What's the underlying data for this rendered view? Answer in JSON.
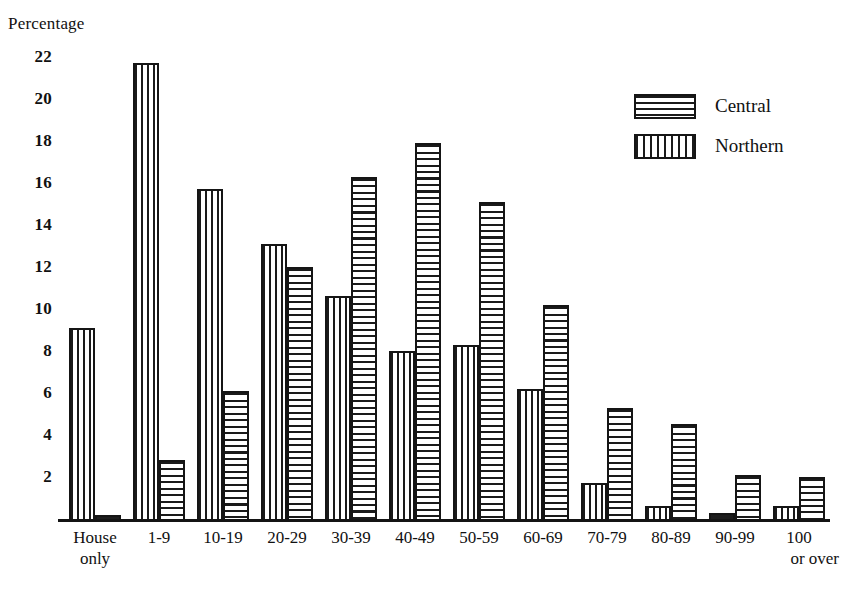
{
  "chart_data": {
    "type": "bar",
    "title": "",
    "xlabel": "",
    "ylabel": "Percentage",
    "ylim": [
      0,
      23
    ],
    "yticks": [
      2,
      4,
      6,
      8,
      10,
      12,
      14,
      16,
      18,
      20,
      22
    ],
    "grid": false,
    "legend_position": "top-right",
    "categories": [
      "House only",
      "1-9",
      "10-19",
      "20-29",
      "30-39",
      "40-49",
      "50-59",
      "60-69",
      "70-79",
      "80-89",
      "90-99",
      "100 or over"
    ],
    "category_labels": [
      {
        "line1": "House",
        "line2": "only",
        "align": "center"
      },
      {
        "line1": "1-9",
        "line2": "",
        "align": "center"
      },
      {
        "line1": "10-19",
        "line2": "",
        "align": "center"
      },
      {
        "line1": "20-29",
        "line2": "",
        "align": "center"
      },
      {
        "line1": "30-39",
        "line2": "",
        "align": "center"
      },
      {
        "line1": "40-49",
        "line2": "",
        "align": "center"
      },
      {
        "line1": "50-59",
        "line2": "",
        "align": "center"
      },
      {
        "line1": "60-69",
        "line2": "",
        "align": "center"
      },
      {
        "line1": "70-79",
        "line2": "",
        "align": "center"
      },
      {
        "line1": "80-89",
        "line2": "",
        "align": "center"
      },
      {
        "line1": "90-99",
        "line2": "",
        "align": "center"
      },
      {
        "line1": "100",
        "line2": "or over",
        "align": "right"
      }
    ],
    "series": [
      {
        "name": "Northern",
        "pattern": "vertical-stripes",
        "color": "#1a1a1a",
        "values": [
          9.2,
          21.8,
          15.8,
          13.2,
          10.7,
          8.1,
          8.4,
          6.3,
          1.8,
          0.7,
          0.4,
          0.7
        ]
      },
      {
        "name": "Central",
        "pattern": "horizontal-stripes",
        "color": "#1a1a1a",
        "values": [
          0.3,
          2.9,
          6.2,
          12.1,
          16.4,
          18.0,
          15.2,
          10.3,
          5.4,
          4.6,
          2.2,
          2.1
        ]
      }
    ]
  },
  "legend": {
    "entries": [
      {
        "label": "Central",
        "pattern": "horizontal-stripes"
      },
      {
        "label": "Northern",
        "pattern": "vertical-stripes"
      }
    ]
  },
  "axis": {
    "y_title": "Percentage"
  }
}
